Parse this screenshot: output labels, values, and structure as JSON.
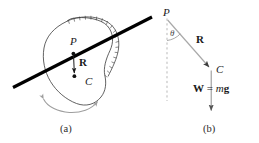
{
  "figure": {
    "panels": [
      {
        "id": "a",
        "caption": "(a)",
        "description": "Irregular rigid body pivoting about a horizontal axis through point P, with center of mass C and position vector R",
        "labels": {
          "pivot": "P",
          "center_of_mass": "C",
          "vector_r": "R"
        }
      },
      {
        "id": "b",
        "caption": "(b)",
        "description": "Free-body diagram showing R from P to C at angle theta from vertical, and weight W = mg acting downward at C",
        "labels": {
          "pivot": "P",
          "center_of_mass": "C",
          "vector_r": "R",
          "angle": "θ",
          "weight_bold": "W",
          "weight_equals": " = ",
          "weight_mass": "m",
          "weight_gravity": "g",
          "weight_full": "W = mg"
        }
      }
    ],
    "colors": {
      "ink": "#1a1a1a",
      "outline": "#3a3a3a",
      "axis_line": "#000000",
      "vector_gray": "#9a9a9a",
      "dashed_gray": "#b4b4b4",
      "arc_gray": "#9e9e9e",
      "caption": "#2b2b2b",
      "background": "#ffffff"
    }
  }
}
